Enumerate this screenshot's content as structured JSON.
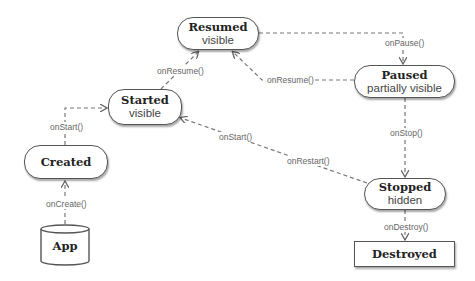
{
  "diagram": {
    "type": "activity-lifecycle-state-diagram",
    "states": [
      {
        "id": "resumed",
        "title": "Resumed",
        "subtitle": "visible"
      },
      {
        "id": "started",
        "title": "Started",
        "subtitle": "visible"
      },
      {
        "id": "paused",
        "title": "Paused",
        "subtitle": "partially visible"
      },
      {
        "id": "created",
        "title": "Created",
        "subtitle": ""
      },
      {
        "id": "stopped",
        "title": "Stopped",
        "subtitle": "hidden"
      },
      {
        "id": "destroyed",
        "title": "Destroyed",
        "subtitle": ""
      },
      {
        "id": "app",
        "title": "App",
        "subtitle": ""
      }
    ],
    "transitions": [
      {
        "from": "app",
        "to": "created",
        "label": "onCreate()"
      },
      {
        "from": "created",
        "to": "started",
        "label": "onStart()"
      },
      {
        "from": "started",
        "to": "resumed",
        "label": "onResume()"
      },
      {
        "from": "resumed",
        "to": "paused",
        "label": "onPause()"
      },
      {
        "from": "paused",
        "to": "resumed",
        "label": "onResume()"
      },
      {
        "from": "paused",
        "to": "stopped",
        "label": "onStop()"
      },
      {
        "from": "stopped",
        "to": "started",
        "label": "onRestart()"
      },
      {
        "from": "stopped",
        "to": "started",
        "label2": "onStart()"
      },
      {
        "from": "stopped",
        "to": "destroyed",
        "label": "onDestroy()"
      }
    ]
  },
  "labels": {
    "resumed_title": "Resumed",
    "resumed_sub": "visible",
    "started_title": "Started",
    "started_sub": "visible",
    "paused_title": "Paused",
    "paused_sub": "partially visible",
    "created_title": "Created",
    "stopped_title": "Stopped",
    "stopped_sub": "hidden",
    "destroyed_title": "Destroyed",
    "app_title": "App",
    "on_create": "onCreate()",
    "on_start_left": "onStart()",
    "on_resume_left": "onResume()",
    "on_pause": "onPause()",
    "on_resume_right": "onResume()",
    "on_stop": "onStop()",
    "on_start_mid": "onStart()",
    "on_restart": "onRestart()",
    "on_destroy": "onDestroy()"
  }
}
